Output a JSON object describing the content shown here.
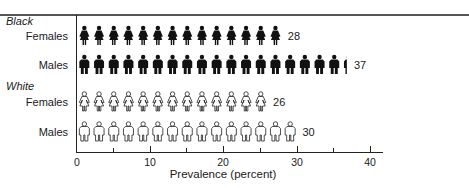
{
  "chart_data": {
    "type": "bar",
    "style": "pictogram",
    "title": "",
    "xlabel": "Prevalence (percent)",
    "ylabel": "",
    "xlim": [
      0,
      40
    ],
    "x_ticks": [
      0,
      10,
      20,
      30,
      40
    ],
    "x_minor_ticks": [
      5,
      15,
      25,
      35
    ],
    "grid": false,
    "unit_per_icon": 2,
    "groups": [
      {
        "name": "Black",
        "series": [
          {
            "name": "Females",
            "value": 28,
            "icon": "female-figure-filled"
          },
          {
            "name": "Males",
            "value": 37,
            "icon": "male-figure-filled"
          }
        ]
      },
      {
        "name": "White",
        "series": [
          {
            "name": "Females",
            "value": 26,
            "icon": "female-figure-outline"
          },
          {
            "name": "Males",
            "value": 30,
            "icon": "male-figure-outline"
          }
        ]
      }
    ],
    "categories": [
      "Black Females",
      "Black Males",
      "White Females",
      "White Males"
    ],
    "values": [
      28,
      37,
      26,
      30
    ]
  },
  "labels": {
    "group_black": "Black",
    "group_white": "White",
    "black_females": "Females",
    "black_males": "Males",
    "white_females": "Females",
    "white_males": "Males",
    "v_black_females": "28",
    "v_black_males": "37",
    "v_white_females": "26",
    "v_white_males": "30",
    "tick_0": "0",
    "tick_10": "10",
    "tick_20": "20",
    "tick_30": "30",
    "tick_40": "40",
    "axis_title": "Prevalence (percent)"
  },
  "colors": {
    "filled": "#111111",
    "outline": "#222222",
    "background": "#ffffff"
  }
}
